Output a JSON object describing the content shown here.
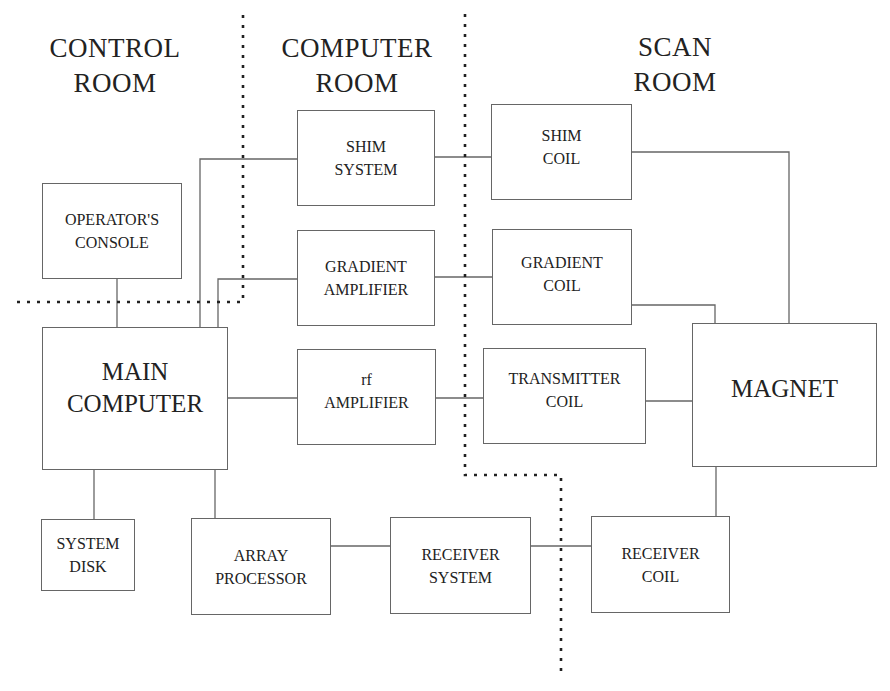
{
  "rooms": {
    "control": "CONTROL\nROOM",
    "computer": "COMPUTER\nROOM",
    "scan": "SCAN\nROOM"
  },
  "blocks": {
    "operators_console": "OPERATOR'S\nCONSOLE",
    "shim_system": "SHIM\nSYSTEM",
    "gradient_amplifier": "GRADIENT\nAMPLIFIER",
    "main_computer": "MAIN\nCOMPUTER",
    "rf_amplifier": "rf\nAMPLIFIER",
    "system_disk": "SYSTEM\nDISK",
    "array_processor": "ARRAY\nPROCESSOR",
    "receiver_system": "RECEIVER\nSYSTEM",
    "shim_coil": "SHIM\nCOIL",
    "gradient_coil": "GRADIENT\nCOIL",
    "transmitter_coil": "TRANSMITTER\nCOIL",
    "magnet": "MAGNET",
    "receiver_coil": "RECEIVER\nCOIL"
  },
  "connections": [
    [
      "operators_console",
      "main_computer"
    ],
    [
      "main_computer",
      "shim_system"
    ],
    [
      "main_computer",
      "gradient_amplifier"
    ],
    [
      "main_computer",
      "rf_amplifier"
    ],
    [
      "main_computer",
      "system_disk"
    ],
    [
      "main_computer",
      "array_processor"
    ],
    [
      "shim_system",
      "shim_coil"
    ],
    [
      "gradient_amplifier",
      "gradient_coil"
    ],
    [
      "rf_amplifier",
      "transmitter_coil"
    ],
    [
      "shim_coil",
      "magnet"
    ],
    [
      "gradient_coil",
      "magnet"
    ],
    [
      "transmitter_coil",
      "magnet"
    ],
    [
      "magnet",
      "receiver_coil"
    ],
    [
      "receiver_coil",
      "receiver_system"
    ],
    [
      "receiver_system",
      "array_processor"
    ]
  ],
  "colors": {
    "line": "#666666",
    "divider": "#222222",
    "text": "#222222"
  }
}
